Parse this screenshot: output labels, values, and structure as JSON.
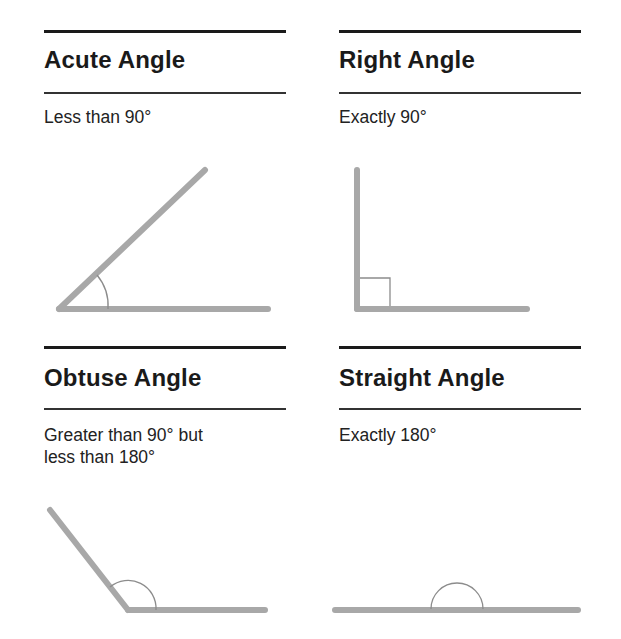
{
  "panels": [
    {
      "id": "acute",
      "title": "Acute Angle",
      "description_lines": [
        "Less than 90°"
      ],
      "angle_degrees": "less than 90"
    },
    {
      "id": "right",
      "title": "Right Angle",
      "description_lines": [
        "Exactly 90°"
      ],
      "angle_degrees": 90
    },
    {
      "id": "obtuse",
      "title": "Obtuse Angle",
      "description_lines": [
        "Greater than 90° but",
        "less than 180°"
      ],
      "angle_degrees": "between 90 and 180"
    },
    {
      "id": "straight",
      "title": "Straight Angle",
      "description_lines": [
        "Exactly 180°"
      ],
      "angle_degrees": 180
    }
  ],
  "colors": {
    "text": "#1a1a1a",
    "ray": "#a8a8a8",
    "marker": "#8c8c8c",
    "rule": "#1a1a1a"
  }
}
